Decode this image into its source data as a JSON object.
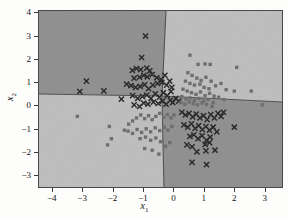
{
  "figure": {
    "background_color": "#fdfdfc",
    "frame_color": "#4a4a4a"
  },
  "axes": {
    "xlabel_text": "x",
    "xlabel_sub": "1",
    "ylabel_text": "x",
    "ylabel_sub": "2",
    "xticks": [
      -4,
      -3,
      -2,
      -1,
      0,
      1,
      2,
      3
    ],
    "xtick_labels": [
      "-4",
      "-3",
      "-2",
      "-1",
      "0",
      "1",
      "2",
      "3"
    ],
    "yticks": [
      -3,
      -2,
      -1,
      0,
      1,
      2,
      3,
      4
    ],
    "ytick_labels": [
      "-3",
      "-2",
      "-1",
      "0",
      "1",
      "2",
      "3",
      "4"
    ],
    "xlim": [
      -4.45,
      3.6
    ],
    "ylim": [
      -3.55,
      4.1
    ]
  },
  "colors": {
    "region_dark": "#8e8e8e",
    "region_light": "#bdbdbd",
    "boundary_line": "#4d4d4d",
    "marker_cross": "#2b2b2b",
    "marker_square": "#6e6e6e",
    "text": "#111111"
  },
  "chart_data": {
    "type": "scatter",
    "title": "",
    "xlabel": "x1",
    "ylabel": "x2",
    "xlim": [
      -4.45,
      3.6
    ],
    "ylim": [
      -3.55,
      4.1
    ],
    "grid": false,
    "legend": "none",
    "decision_regions": [
      {
        "name": "upper-left",
        "class": "cross",
        "shade": "dark",
        "color": "#8e8e8e"
      },
      {
        "name": "upper-right",
        "class": "square",
        "shade": "light",
        "color": "#bdbdbd"
      },
      {
        "name": "lower-left",
        "class": "square",
        "shade": "light",
        "color": "#bdbdbd"
      },
      {
        "name": "lower-right",
        "class": "cross",
        "shade": "dark",
        "color": "#8e8e8e"
      }
    ],
    "decision_boundaries": [
      {
        "name": "near-vertical-boundary",
        "from": [
          0.17,
          4.1
        ],
        "to": [
          0.05,
          -3.55
        ],
        "via": [
          -0.05,
          0.05
        ]
      },
      {
        "name": "left-horizontal-boundary",
        "from": [
          -4.45,
          0.07
        ],
        "to": [
          -0.05,
          0.05
        ]
      },
      {
        "name": "right-horizontal-boundary",
        "from": [
          -0.05,
          0.05
        ],
        "to": [
          3.6,
          -0.25
        ]
      }
    ],
    "series": [
      {
        "name": "class-1-cross",
        "marker": "x",
        "color": "#2b2b2b",
        "count": 92,
        "points": [
          [
            -0.92,
            3.01
          ],
          [
            -1.05,
            2.08
          ],
          [
            -1.22,
            1.6
          ],
          [
            -1.36,
            1.52
          ],
          [
            -1.08,
            1.55
          ],
          [
            -0.88,
            1.62
          ],
          [
            -0.78,
            1.5
          ],
          [
            -1.3,
            1.18
          ],
          [
            -1.12,
            1.22
          ],
          [
            -0.98,
            1.3
          ],
          [
            -0.86,
            1.24
          ],
          [
            -0.7,
            1.34
          ],
          [
            -0.55,
            1.2
          ],
          [
            -0.4,
            1.12
          ],
          [
            -0.28,
            1.3
          ],
          [
            -2.88,
            1.05
          ],
          [
            -3.1,
            0.6
          ],
          [
            -2.3,
            0.63
          ],
          [
            -1.72,
            0.27
          ],
          [
            -1.55,
            0.92
          ],
          [
            -1.4,
            0.86
          ],
          [
            -1.25,
            0.78
          ],
          [
            -1.1,
            0.82
          ],
          [
            -0.95,
            0.9
          ],
          [
            -0.82,
            0.72
          ],
          [
            -0.68,
            0.88
          ],
          [
            -0.52,
            0.95
          ],
          [
            -0.38,
            1.0
          ],
          [
            -0.22,
            0.88
          ],
          [
            -0.12,
            1.05
          ],
          [
            -0.05,
            0.78
          ],
          [
            -1.35,
            0.42
          ],
          [
            -1.18,
            0.3
          ],
          [
            -1.02,
            0.38
          ],
          [
            -0.88,
            0.45
          ],
          [
            -0.74,
            0.3
          ],
          [
            -0.6,
            0.5
          ],
          [
            -0.46,
            0.35
          ],
          [
            -0.33,
            0.55
          ],
          [
            -0.2,
            0.42
          ],
          [
            -0.08,
            0.6
          ],
          [
            -1.3,
            0.02
          ],
          [
            -1.12,
            -0.05
          ],
          [
            -0.98,
            0.1
          ],
          [
            -0.84,
            0.05
          ],
          [
            -0.66,
            0.14
          ],
          [
            -0.5,
            0.08
          ],
          [
            -0.36,
            0.18
          ],
          [
            -0.24,
            0.05
          ],
          [
            -0.1,
            0.22
          ],
          [
            -0.02,
            0.12
          ],
          [
            0.08,
            0.3
          ],
          [
            0.18,
            0.18
          ],
          [
            0.28,
            -0.3
          ],
          [
            0.4,
            -0.42
          ],
          [
            0.52,
            -0.35
          ],
          [
            0.64,
            -0.5
          ],
          [
            0.76,
            -0.38
          ],
          [
            0.88,
            -0.55
          ],
          [
            1.0,
            -0.45
          ],
          [
            1.12,
            -0.62
          ],
          [
            1.24,
            -0.4
          ],
          [
            1.36,
            -0.55
          ],
          [
            1.48,
            -0.35
          ],
          [
            1.58,
            -0.48
          ],
          [
            1.66,
            -0.3
          ],
          [
            0.35,
            -0.85
          ],
          [
            0.48,
            -0.95
          ],
          [
            0.6,
            -0.8
          ],
          [
            0.72,
            -1.0
          ],
          [
            0.84,
            -0.88
          ],
          [
            0.96,
            -1.05
          ],
          [
            1.08,
            -0.92
          ],
          [
            1.2,
            -1.08
          ],
          [
            1.32,
            -0.95
          ],
          [
            1.44,
            -1.15
          ],
          [
            0.55,
            -1.35
          ],
          [
            0.68,
            -1.28
          ],
          [
            0.82,
            -1.45
          ],
          [
            0.95,
            -1.32
          ],
          [
            1.1,
            -1.52
          ],
          [
            1.22,
            -1.38
          ],
          [
            1.05,
            -1.7
          ],
          [
            1.2,
            -1.62
          ],
          [
            0.45,
            -1.72
          ],
          [
            0.62,
            -1.8
          ],
          [
            0.78,
            -2.02
          ],
          [
            1.08,
            -1.98
          ],
          [
            1.38,
            -1.95
          ],
          [
            2.02,
            -0.95
          ],
          [
            0.62,
            -2.48
          ],
          [
            1.1,
            -2.58
          ]
        ]
      },
      {
        "name": "class-2-square",
        "marker": "s",
        "color": "#6e6e6e",
        "count": 88,
        "points": [
          [
            0.55,
            2.18
          ],
          [
            0.82,
            1.78
          ],
          [
            1.05,
            1.8
          ],
          [
            1.22,
            1.78
          ],
          [
            2.1,
            1.65
          ],
          [
            0.48,
            1.42
          ],
          [
            0.62,
            1.3
          ],
          [
            0.78,
            1.18
          ],
          [
            0.92,
            1.08
          ],
          [
            1.08,
            1.22
          ],
          [
            1.25,
            1.05
          ],
          [
            1.4,
            0.85
          ],
          [
            0.4,
            1.05
          ],
          [
            0.55,
            0.95
          ],
          [
            0.7,
            0.88
          ],
          [
            0.88,
            0.92
          ],
          [
            1.02,
            0.78
          ],
          [
            1.18,
            0.72
          ],
          [
            1.58,
            0.95
          ],
          [
            1.75,
            0.68
          ],
          [
            2.02,
            0.62
          ],
          [
            2.58,
            0.62
          ],
          [
            0.32,
            0.7
          ],
          [
            0.46,
            0.62
          ],
          [
            0.6,
            0.55
          ],
          [
            0.75,
            0.48
          ],
          [
            0.9,
            0.58
          ],
          [
            1.05,
            0.42
          ],
          [
            1.2,
            0.52
          ],
          [
            1.35,
            0.4
          ],
          [
            1.5,
            0.35
          ],
          [
            1.68,
            0.25
          ],
          [
            0.28,
            0.38
          ],
          [
            0.42,
            0.28
          ],
          [
            0.56,
            0.32
          ],
          [
            0.7,
            0.22
          ],
          [
            0.85,
            0.3
          ],
          [
            1.0,
            0.18
          ],
          [
            1.15,
            0.25
          ],
          [
            1.32,
            0.12
          ],
          [
            0.25,
            0.12
          ],
          [
            0.38,
            0.05
          ],
          [
            0.52,
            0.15
          ],
          [
            0.66,
            0.08
          ],
          [
            0.8,
            0.02
          ],
          [
            0.95,
            0.1
          ],
          [
            1.1,
            0.04
          ],
          [
            1.28,
            -0.05
          ],
          [
            2.95,
            0.02
          ],
          [
            -3.18,
            -0.48
          ],
          [
            -2.12,
            -0.92
          ],
          [
            -2.05,
            -1.45
          ],
          [
            -2.18,
            -1.72
          ],
          [
            -1.62,
            -1.08
          ],
          [
            -1.48,
            -0.82
          ],
          [
            -1.35,
            -0.68
          ],
          [
            -1.22,
            -0.55
          ],
          [
            -1.08,
            -0.42
          ],
          [
            -0.95,
            -0.58
          ],
          [
            -0.82,
            -0.45
          ],
          [
            -0.7,
            -0.62
          ],
          [
            -0.58,
            -0.48
          ],
          [
            -0.45,
            -0.35
          ],
          [
            -0.32,
            -0.52
          ],
          [
            -0.2,
            -0.4
          ],
          [
            -0.08,
            -0.55
          ],
          [
            0.02,
            -0.42
          ],
          [
            -1.5,
            -1.12
          ],
          [
            -1.35,
            -1.22
          ],
          [
            -1.2,
            -1.05
          ],
          [
            -1.05,
            -1.18
          ],
          [
            -0.9,
            -1.02
          ],
          [
            -0.75,
            -1.15
          ],
          [
            -0.6,
            -0.98
          ],
          [
            -0.45,
            -1.1
          ],
          [
            -0.3,
            -0.95
          ],
          [
            -0.18,
            -1.08
          ],
          [
            -0.05,
            -0.92
          ],
          [
            -1.1,
            -1.45
          ],
          [
            -0.92,
            -1.38
          ],
          [
            -0.75,
            -1.52
          ],
          [
            -0.58,
            -1.42
          ],
          [
            -0.42,
            -1.58
          ],
          [
            -0.95,
            -1.88
          ],
          [
            -0.7,
            -1.95
          ],
          [
            -0.48,
            -2.12
          ],
          [
            -0.26,
            -1.78
          ],
          [
            -0.12,
            -1.62
          ]
        ]
      }
    ]
  }
}
